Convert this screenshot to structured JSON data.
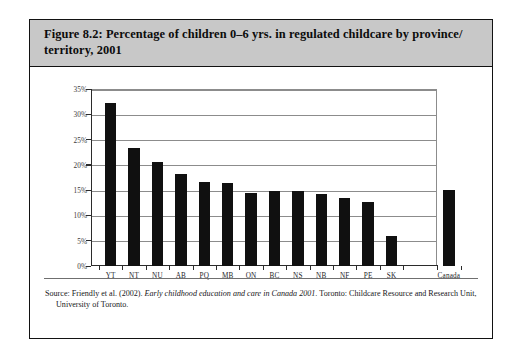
{
  "figure": {
    "title": "Figure 8.2: Percentage of children 0–6 yrs. in regulated childcare by province/ territory, 2001",
    "source_prefix": "Source: Friendly et al. (2002). ",
    "source_italic": "Early childhood education and care in Canada 2001",
    "source_suffix": ". Toronto: Childcare Resource and Research Unit, University of Toronto."
  },
  "chart_data": {
    "type": "bar",
    "xlabel": "",
    "ylabel": "Percent of children 0 to 6 yrs",
    "categories": [
      "YT",
      "NT",
      "NU",
      "AB",
      "PQ",
      "MB",
      "ON",
      "BC",
      "NS",
      "NB",
      "NF",
      "PE",
      "SK",
      "Canada"
    ],
    "values": [
      32.2,
      23.3,
      20.5,
      18.1,
      16.7,
      16.4,
      14.4,
      14.9,
      14.8,
      14.2,
      13.4,
      12.7,
      5.9,
      15.0
    ],
    "ylim": [
      0,
      35
    ],
    "yticks": [
      0,
      5,
      10,
      15,
      20,
      25,
      30,
      35
    ],
    "ytick_labels": [
      "0%",
      "5%",
      "10%",
      "15%",
      "20%",
      "25%",
      "30%",
      "35%"
    ],
    "grid": true,
    "legend": "none",
    "bar_color": "#101010",
    "separated_last_category": true
  }
}
